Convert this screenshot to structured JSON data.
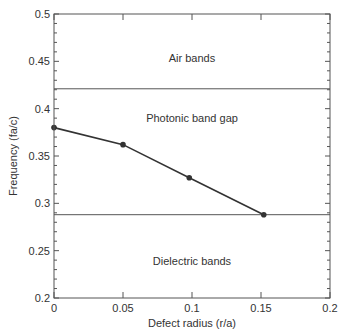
{
  "chart_data": {
    "type": "line",
    "title": "",
    "xlabel": "Defect radius (r/a)",
    "ylabel": "Frequency (fa/c)",
    "xlim": [
      0,
      0.2
    ],
    "ylim": [
      0.2,
      0.5
    ],
    "x_ticks": [
      "0",
      "0.05",
      "0.1",
      "0.15",
      "0.2"
    ],
    "y_ticks": [
      "0.2",
      "0.25",
      "0.3",
      "0.35",
      "0.4",
      "0.45",
      "0.5"
    ],
    "grid": false,
    "legend": null,
    "series": [
      {
        "name": "Defect mode",
        "x": [
          0,
          0.05,
          0.098,
          0.152
        ],
        "values": [
          0.38,
          0.362,
          0.327,
          0.288
        ],
        "marker": "circle",
        "color": "#333333"
      }
    ],
    "reference_lines": [
      {
        "name": "Top of dielectric bands",
        "y": 0.288,
        "color": "#555555"
      },
      {
        "name": "Bottom of air bands",
        "y": 0.421,
        "color": "#555555"
      }
    ],
    "annotations": [
      {
        "text": "Air bands",
        "x": 0.1,
        "y": 0.455
      },
      {
        "text": "Photonic band gap",
        "x": 0.1,
        "y": 0.39
      },
      {
        "text": "Dielectric bands",
        "x": 0.1,
        "y": 0.246
      }
    ]
  },
  "labels": {
    "xlabel": "Defect radius (r/a)",
    "ylabel": "Frequency (fa/c)",
    "air_bands": "Air bands",
    "band_gap": "Photonic band gap",
    "dielectric_bands": "Dielectric bands"
  }
}
